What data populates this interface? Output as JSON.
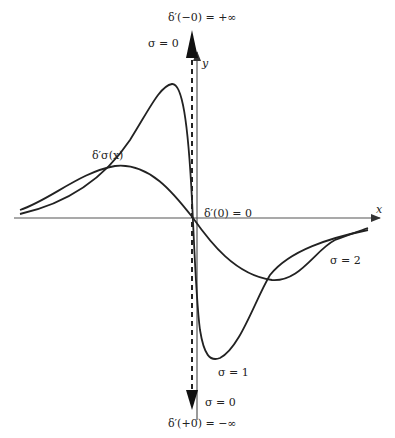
{
  "diagram": {
    "axes": {
      "x_label": "x",
      "y_label": "y"
    },
    "labels": {
      "top_limit": "δ′(−0) = +∞",
      "top_sigma": "σ = 0",
      "origin_value": "δ′(0) = 0",
      "curve_label": "δ′σ(x)",
      "sigma1": "σ = 1",
      "sigma2": "σ = 2",
      "bottom_sigma": "σ = 0",
      "bottom_limit": "δ′(+0) = −∞"
    },
    "curves": [
      {
        "name": "sigma=1",
        "description": "narrow, tall derivative curve",
        "peak": [
          170,
          84
        ],
        "trough": [
          216,
          360
        ]
      },
      {
        "name": "sigma=2",
        "description": "wide, shallow derivative curve",
        "peak": [
          115,
          166
        ],
        "trough": [
          272,
          280
        ]
      },
      {
        "name": "sigma=0",
        "description": "limiting dashed vertical line with arrows to +inf and -inf"
      }
    ],
    "colors": {
      "ink": "#222222",
      "axis": "#444444",
      "background": "#ffffff"
    }
  }
}
